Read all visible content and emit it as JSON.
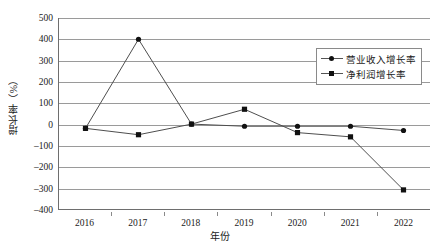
{
  "chart_data": {
    "type": "line",
    "title": "",
    "xlabel": "年份",
    "ylabel": "增长率（%）",
    "categories": [
      "2016",
      "2017",
      "2018",
      "2019",
      "2020",
      "2021",
      "2022"
    ],
    "ylim": [
      -400,
      500
    ],
    "ytick_step": 100,
    "yticks": [
      "500",
      "400",
      "300",
      "200",
      "100",
      "0",
      "-100",
      "-200",
      "-300",
      "-400"
    ],
    "grid": true,
    "legend_position": "top-right-inside",
    "series": [
      {
        "name": "营业收入增长率",
        "marker": "circle",
        "color": "#111111",
        "values": [
          -20,
          400,
          0,
          -10,
          -10,
          -10,
          -30
        ]
      },
      {
        "name": "净利润增长率",
        "marker": "square",
        "color": "#111111",
        "values": [
          -20,
          -50,
          0,
          70,
          -40,
          -60,
          -310
        ]
      }
    ]
  },
  "legend": {
    "items": [
      {
        "label": "营业收入增长率",
        "marker": "circle"
      },
      {
        "label": "净利润增长率",
        "marker": "square"
      }
    ]
  },
  "axes": {
    "y_title": "增长率（%）",
    "x_title": "年份"
  }
}
